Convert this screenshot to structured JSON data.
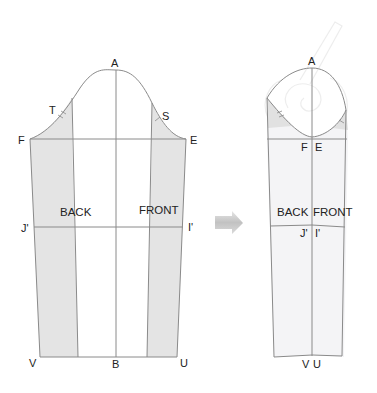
{
  "diagram": {
    "title": "",
    "left_pattern": {
      "points": {
        "A": "A",
        "T": "T",
        "S": "S",
        "F": "F",
        "E": "E",
        "J": "J'",
        "I": "I'",
        "V": "V",
        "B": "B",
        "U": "U"
      },
      "pieces": {
        "back": "BACK",
        "front": "FRONT"
      }
    },
    "arrow": {
      "direction": "right"
    },
    "right_pattern": {
      "points": {
        "A": "A",
        "F": "F",
        "E": "E",
        "J": "J'",
        "I": "I'",
        "V": "V",
        "U": "U"
      },
      "pieces": {
        "back": "BACK",
        "front": "FRONT"
      }
    },
    "colors": {
      "shade": "#e3e3e3",
      "line": "#8a8a8a",
      "text": "#222222",
      "arrow": "#c4c4c4"
    }
  }
}
